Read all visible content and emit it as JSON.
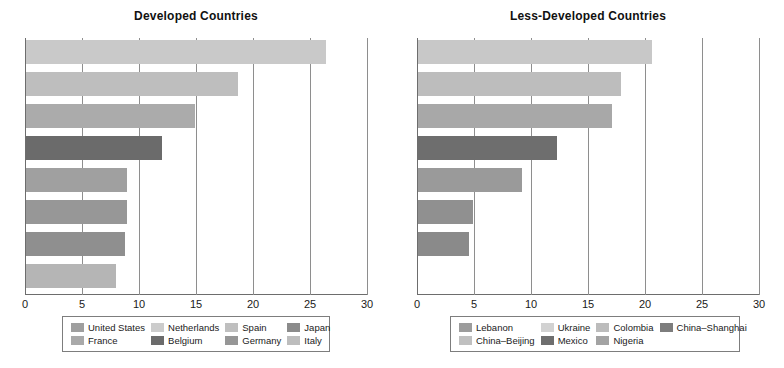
{
  "chart_data": [
    {
      "type": "bar",
      "orientation": "horizontal",
      "title": "Developed Countries",
      "xlabel": "",
      "ylabel": "",
      "xlim": [
        0,
        30
      ],
      "xticks": [
        "0",
        "5",
        "10",
        "15",
        "20",
        "25",
        "30"
      ],
      "xtick_values": [
        0,
        5,
        10,
        15,
        20,
        25,
        30
      ],
      "grid": true,
      "legend_position": "bottom",
      "categories": [
        "United States",
        "France",
        "Netherlands",
        "Belgium",
        "Spain",
        "Germany",
        "Japan",
        "Italy"
      ],
      "values": [
        26.3,
        18.6,
        14.8,
        11.9,
        8.9,
        8.9,
        8.7,
        7.9
      ],
      "colors": [
        "#c9c9c9",
        "#bebebe",
        "#ababab",
        "#6b6b6b",
        "#a0a0a0",
        "#979797",
        "#8f8f8f",
        "#b5b5b5"
      ],
      "legend": [
        {
          "label": "United States",
          "color": "#9f9f9f"
        },
        {
          "label": "France",
          "color": "#a9a9a9"
        },
        {
          "label": "Netherlands",
          "color": "#cccccc"
        },
        {
          "label": "Belgium",
          "color": "#6b6b6b"
        },
        {
          "label": "Spain",
          "color": "#bfbfbf"
        },
        {
          "label": "Germany",
          "color": "#969696"
        },
        {
          "label": "Japan",
          "color": "#8b8b8b"
        },
        {
          "label": "Italy",
          "color": "#bdbdbd"
        }
      ]
    },
    {
      "type": "bar",
      "orientation": "horizontal",
      "title": "Less-Developed Countries",
      "xlabel": "",
      "ylabel": "",
      "xlim": [
        0,
        30
      ],
      "xticks": [
        "0",
        "5",
        "10",
        "15",
        "20",
        "25",
        "30"
      ],
      "xtick_values": [
        0,
        5,
        10,
        15,
        20,
        25,
        30
      ],
      "grid": true,
      "legend_position": "bottom",
      "categories": [
        "Lebanon",
        "China–Beijing",
        "Ukraine",
        "Mexico",
        "Colombia",
        "Nigeria",
        "China–Shanghai"
      ],
      "values": [
        20.5,
        17.8,
        17.0,
        12.2,
        9.1,
        4.8,
        4.5
      ],
      "colors": [
        "#c8c8c8",
        "#bdbdbd",
        "#a8a8a8",
        "#6e6e6e",
        "#9a9a9a",
        "#909090",
        "#8a8a8a"
      ],
      "legend": [
        {
          "label": "Lebanon",
          "color": "#9c9c9c"
        },
        {
          "label": "China–Beijing",
          "color": "#c0c0c0"
        },
        {
          "label": "Ukraine",
          "color": "#d2d2d2"
        },
        {
          "label": "Mexico",
          "color": "#6e6e6e"
        },
        {
          "label": "Colombia",
          "color": "#bcbcbc"
        },
        {
          "label": "Nigeria",
          "color": "#a3a3a3"
        },
        {
          "label": "China–Shanghai",
          "color": "#7d7d7d"
        }
      ]
    }
  ]
}
